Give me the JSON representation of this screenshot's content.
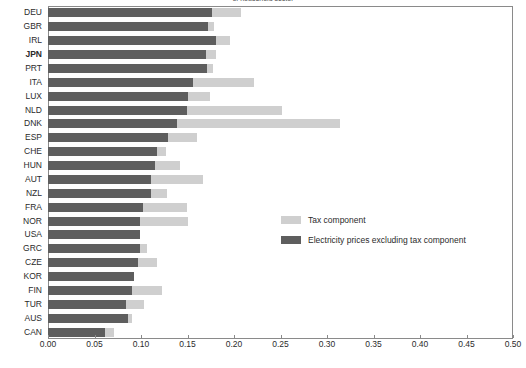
{
  "chart_data": {
    "type": "bar",
    "orientation": "horizontal",
    "stacked": true,
    "title": "of household sector",
    "xlabel": "",
    "ylabel": "",
    "xlim": [
      0.0,
      0.5
    ],
    "xticks": [
      "0.00",
      "0.05",
      "0.10",
      "0.15",
      "0.20",
      "0.25",
      "0.30",
      "0.35",
      "0.40",
      "0.45",
      "0.50"
    ],
    "xtick_values": [
      0.0,
      0.05,
      0.1,
      0.15,
      0.2,
      0.25,
      0.3,
      0.35,
      0.4,
      0.45,
      0.5
    ],
    "grid": false,
    "legend_position": "center-right",
    "categories": [
      "DEU",
      "GBR",
      "IRL",
      "JPN",
      "PRT",
      "ITA",
      "LUX",
      "NLD",
      "DNK",
      "ESP",
      "CHE",
      "HUN",
      "AUT",
      "NZL",
      "FRA",
      "NOR",
      "USA",
      "GRC",
      "CZE",
      "KOR",
      "FIN",
      "TUR",
      "AUS",
      "CAN"
    ],
    "highlighted_category": "JPN",
    "series": [
      {
        "name": "Electricity prices excluding tax component",
        "color": "#5e5e5e",
        "values": [
          0.176,
          0.172,
          0.181,
          0.17,
          0.171,
          0.156,
          0.151,
          0.149,
          0.139,
          0.129,
          0.117,
          0.115,
          0.111,
          0.111,
          0.102,
          0.099,
          0.099,
          0.099,
          0.097,
          0.093,
          0.09,
          0.084,
          0.086,
          0.061
        ]
      },
      {
        "name": "Tax component",
        "color": "#cfcfcf",
        "values": [
          0.031,
          0.006,
          0.015,
          0.011,
          0.006,
          0.065,
          0.023,
          0.103,
          0.175,
          0.031,
          0.01,
          0.027,
          0.056,
          0.017,
          0.047,
          0.052,
          0.0,
          0.007,
          0.02,
          0.0,
          0.033,
          0.019,
          0.004,
          0.01
        ]
      }
    ],
    "totals": [
      0.207,
      0.178,
      0.196,
      0.181,
      0.177,
      0.221,
      0.174,
      0.252,
      0.314,
      0.16,
      0.127,
      0.142,
      0.167,
      0.128,
      0.149,
      0.151,
      0.099,
      0.106,
      0.117,
      0.093,
      0.123,
      0.103,
      0.09,
      0.071
    ]
  },
  "legend": {
    "items": [
      {
        "label": "Tax component",
        "color": "#cfcfcf"
      },
      {
        "label": "Electricity prices excluding tax component",
        "color": "#5e5e5e"
      }
    ]
  }
}
